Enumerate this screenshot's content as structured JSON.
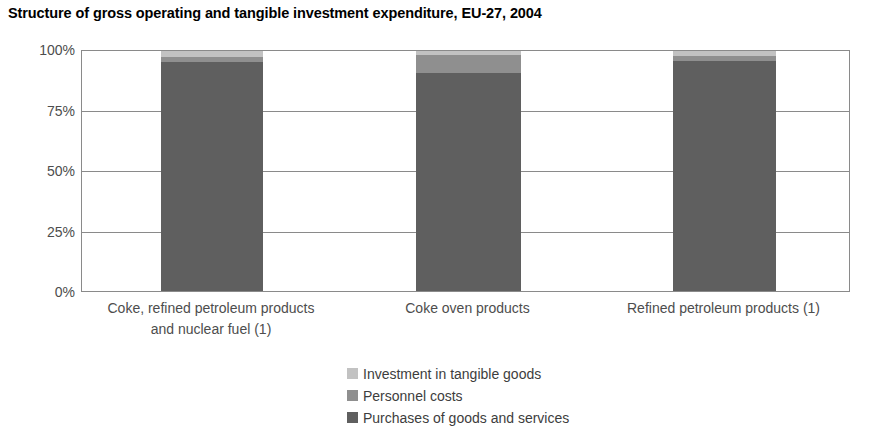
{
  "chart_data": {
    "type": "bar",
    "title": "Structure of gross operating and tangible investment expenditure, EU-27, 2004",
    "xlabel": "",
    "ylabel": "",
    "ylim": [
      0,
      100
    ],
    "stacked": true,
    "grid": true,
    "legend_position": "bottom",
    "categories": [
      "Coke, refined petroleum products and nuclear fuel (1)",
      "Coke oven products",
      "Refined petroleum products (1)"
    ],
    "category_lines": [
      [
        "Coke, refined petroleum products",
        "and nuclear fuel (1)"
      ],
      [
        "Coke oven products"
      ],
      [
        "Refined petroleum products (1)"
      ]
    ],
    "series": [
      {
        "name": "Purchases of goods and services",
        "color": "#5f5f5f",
        "values": [
          95.5,
          91.0,
          96.0
        ]
      },
      {
        "name": "Personnel costs",
        "color": "#8f8f8f",
        "values": [
          2.0,
          7.5,
          2.0
        ]
      },
      {
        "name": "Investment in tangible goods",
        "color": "#c2c2c2",
        "values": [
          2.5,
          1.5,
          2.0
        ]
      }
    ],
    "ytick_labels": [
      "0%",
      "25%",
      "50%",
      "75%",
      "100%"
    ],
    "ytick_values": [
      0,
      25,
      50,
      75,
      100
    ],
    "legend_entries": [
      {
        "label": "Investment in tangible goods",
        "color": "#c2c2c2"
      },
      {
        "label": "Personnel costs",
        "color": "#8f8f8f"
      },
      {
        "label": "Purchases of goods and services",
        "color": "#5f5f5f"
      }
    ]
  }
}
